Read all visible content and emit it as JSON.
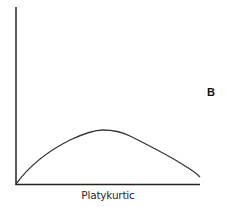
{
  "figure": {
    "panel_label": "B",
    "x_axis_label": "Platykurtic",
    "curve_description": "platykurtic distribution (flat, broad peak)",
    "colors": {
      "axis": "#222222",
      "curve": "#333333",
      "background": "#ffffff"
    }
  }
}
